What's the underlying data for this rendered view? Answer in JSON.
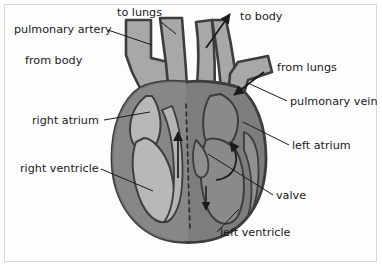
{
  "diagram": {
    "type": "anatomical-diagram",
    "background_color": "#fdfdfd",
    "frame_color": "#d8d8d8",
    "colors": {
      "muscle_dark": "#7d7d7d",
      "chamber_light": "#b4b4b4",
      "chamber_mid": "#9a9a9a",
      "vessel_fill": "#a8a8a8",
      "outline": "#3d3d3d",
      "leader_line": "#1a1a1a",
      "text": "#1a1a1a",
      "septum_dashed": "#2a2a2a"
    },
    "labels": [
      {
        "id": "pulmonary-artery",
        "text": "pulmonary artery",
        "x": 14,
        "y": 33,
        "anchor": "start"
      },
      {
        "id": "to-lungs",
        "text": "to lungs",
        "x": 117,
        "y": 16,
        "anchor": "start"
      },
      {
        "id": "to-body",
        "text": "to body",
        "x": 240,
        "y": 20,
        "anchor": "start"
      },
      {
        "id": "from-body",
        "text": "from body",
        "x": 25,
        "y": 64,
        "anchor": "start"
      },
      {
        "id": "from-lungs",
        "text": "from lungs",
        "x": 277,
        "y": 71,
        "anchor": "start"
      },
      {
        "id": "pulmonary-vein",
        "text": "pulmonary vein",
        "x": 290,
        "y": 105,
        "anchor": "start"
      },
      {
        "id": "right-atrium",
        "text": "right atrium",
        "x": 32,
        "y": 124,
        "anchor": "start"
      },
      {
        "id": "left-atrium",
        "text": "left atrium",
        "x": 292,
        "y": 149,
        "anchor": "start"
      },
      {
        "id": "right-ventricle",
        "text": "right ventricle",
        "x": 20,
        "y": 172,
        "anchor": "start"
      },
      {
        "id": "valve",
        "text": "valve",
        "x": 276,
        "y": 199,
        "anchor": "start"
      },
      {
        "id": "left-ventricle",
        "text": "left ventricle",
        "x": 220,
        "y": 236,
        "anchor": "start"
      }
    ],
    "leader_lines": [
      {
        "id": "leader-pulmonary-artery",
        "points": "108,30 152,45"
      },
      {
        "id": "leader-to-lungs",
        "points": "160,22 176,33"
      },
      {
        "id": "leader-right-atrium",
        "points": "104,120 150,113"
      },
      {
        "id": "leader-right-ventricle",
        "points": "101,168 153,190"
      },
      {
        "id": "leader-pulmonary-vein",
        "points": "286,101 250,84"
      },
      {
        "id": "leader-left-atrium",
        "points": "288,145 243,122"
      },
      {
        "id": "leader-valve",
        "points": "272,195 207,154"
      },
      {
        "id": "leader-left-ventricle",
        "points": "216,232 238,208"
      }
    ],
    "flow_arrows": [
      {
        "id": "arrow-to-body",
        "description": "aorta outflow arrow pointing up-right",
        "path": "M 206,46 L 229,13",
        "head": "229,13"
      },
      {
        "id": "arrow-from-lungs",
        "description": "pulmonary vein inflow arrow pointing down-left",
        "path": "M 262,73 L 232,96",
        "head": "232,96"
      },
      {
        "id": "arrow-left-ventricle",
        "description": "curved arrow inside left ventricle pointing up",
        "path": "M 218,178 C 236,176 240,158 229,140",
        "head": "229,140"
      },
      {
        "id": "arrow-right-ventricle",
        "description": "arrow inside right ventricle pointing up",
        "path": "M 178,176 L 178,130",
        "head": "178,130"
      }
    ],
    "septum": {
      "id": "septum-midline",
      "description": "dashed vertical midline separating right and left sides",
      "path": "M 186,104 L 190,230"
    }
  }
}
